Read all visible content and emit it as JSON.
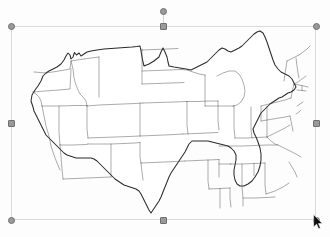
{
  "app": {
    "background_color": "#fdfdfd",
    "object_type": "image",
    "object_title": "United States Map"
  },
  "selection": {
    "frame_color": "#d8dade",
    "handle_fill": "#9a9a9a",
    "handle_border": "#6f6f6f",
    "frame": {
      "x": 11,
      "y": 26,
      "width": 305,
      "height": 194
    },
    "handles": [
      {
        "name": "handle-top-left",
        "label": "Top left resize handle",
        "x": 11,
        "y": 26,
        "shape": "circle"
      },
      {
        "name": "handle-top-center",
        "label": "Top center resize handle",
        "x": 163,
        "y": 26,
        "shape": "square"
      },
      {
        "name": "handle-top-right",
        "label": "Top right resize handle",
        "x": 316,
        "y": 26,
        "shape": "circle"
      },
      {
        "name": "handle-middle-left",
        "label": "Middle left resize handle",
        "x": 11,
        "y": 123,
        "shape": "square"
      },
      {
        "name": "handle-middle-right",
        "label": "Middle right resize handle",
        "x": 316,
        "y": 123,
        "shape": "square"
      },
      {
        "name": "handle-bottom-left",
        "label": "Bottom left resize handle",
        "x": 11,
        "y": 220,
        "shape": "circle"
      },
      {
        "name": "handle-bottom-center",
        "label": "Bottom center resize handle",
        "x": 163,
        "y": 220,
        "shape": "square"
      },
      {
        "name": "handle-bottom-right",
        "label": "Bottom right resize handle",
        "x": 316,
        "y": 220,
        "shape": "circle"
      }
    ],
    "rotate_handle": {
      "name": "rotate-handle",
      "label": "Rotate handle",
      "x": 163,
      "y": 11,
      "shape": "circle"
    },
    "rotate_stem": {
      "x": 163,
      "y": 11,
      "height": 15
    }
  },
  "cursor": {
    "name": "mouse-pointer",
    "label": "Mouse pointer",
    "x": 313,
    "y": 214,
    "color": "#111111"
  },
  "map": {
    "title": "Blank outline map of the contiguous United States",
    "region": "Contiguous United States",
    "style": "blank outline, state borders, no labels",
    "fill_color": "#ffffff",
    "outline_color": "#2b2b2b",
    "border_color": "#3a3a3a",
    "states_shown": [
      "Washington",
      "Oregon",
      "California",
      "Nevada",
      "Idaho",
      "Montana",
      "Wyoming",
      "Utah",
      "Arizona",
      "Colorado",
      "New Mexico",
      "North Dakota",
      "South Dakota",
      "Nebraska",
      "Kansas",
      "Oklahoma",
      "Texas",
      "Minnesota",
      "Iowa",
      "Missouri",
      "Arkansas",
      "Louisiana",
      "Wisconsin",
      "Illinois",
      "Michigan",
      "Indiana",
      "Ohio",
      "Kentucky",
      "Tennessee",
      "Mississippi",
      "Alabama",
      "Georgia",
      "Florida",
      "South Carolina",
      "North Carolina",
      "Virginia",
      "West Virginia",
      "Maryland",
      "Delaware",
      "Pennsylvania",
      "New Jersey",
      "New York",
      "Connecticut",
      "Rhode Island",
      "Massachusetts",
      "Vermont",
      "New Hampshire",
      "Maine"
    ]
  }
}
